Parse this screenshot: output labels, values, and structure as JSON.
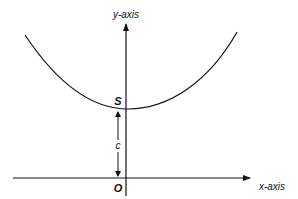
{
  "diagram": {
    "type": "catenary-curve",
    "labels": {
      "y_axis": "y-axis",
      "x_axis": "x-axis",
      "vertex": "S",
      "origin": "O",
      "height": "c"
    },
    "colors": {
      "line": "#111111",
      "background": "#ffffff"
    }
  }
}
